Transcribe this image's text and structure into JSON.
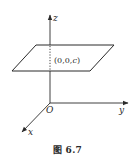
{
  "figure": {
    "caption": "图 6.7",
    "axes": {
      "x_label": "x",
      "y_label": "y",
      "z_label": "z",
      "origin_label": "O"
    },
    "plane": {
      "point_label_prefix": "(0,0,",
      "point_label_var": "c",
      "point_label_suffix": ")",
      "description": "Plane z = c parallel to xOy plane, intersecting z-axis at (0,0,c)"
    },
    "colors": {
      "line": "#2a2a2a",
      "background": "#ffffff"
    }
  }
}
